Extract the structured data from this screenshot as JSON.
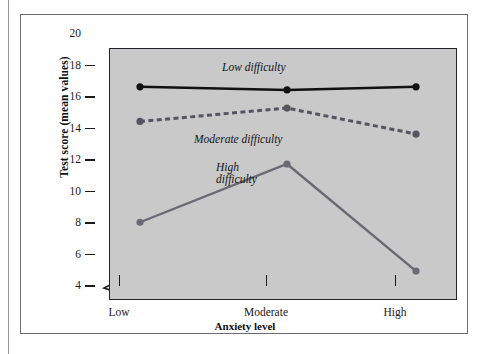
{
  "figure": {
    "background_color": "#ffffff",
    "frame_color": "#6b6b76",
    "plot_background_color": "#c9c9c9",
    "axis_color": "#1a1a1a"
  },
  "axes": {
    "y_title": "Test score (mean values)",
    "x_title": "Anxiety level",
    "y_ticks": [
      "20",
      "18",
      "16",
      "14",
      "12",
      "10",
      "8",
      "6",
      "4"
    ],
    "x_ticks": [
      "Low",
      "Moderate",
      "High"
    ],
    "axis_break_symbol": "axis-break"
  },
  "annotations": {
    "low": "Low difficulty",
    "moderate": "Moderate difficulty",
    "high": "High\ndifficulty"
  },
  "chart_data": {
    "type": "line",
    "title": "",
    "xlabel": "Anxiety level",
    "ylabel": "Test score (mean values)",
    "categories": [
      "Low",
      "Moderate",
      "High"
    ],
    "ylim": [
      4,
      20
    ],
    "yticks": [
      4,
      6,
      8,
      10,
      12,
      14,
      16,
      18,
      20
    ],
    "grid": false,
    "legend": "inline-annotations",
    "axis_break": true,
    "series": [
      {
        "name": "Low difficulty",
        "values": [
          17.6,
          17.4,
          17.6
        ],
        "color": "#111111",
        "style": "solid",
        "marker": "circle"
      },
      {
        "name": "Moderate difficulty",
        "values": [
          15.4,
          16.25,
          14.6
        ],
        "color": "#555560",
        "style": "dashed",
        "marker": "circle"
      },
      {
        "name": "High difficulty",
        "values": [
          9.0,
          12.7,
          5.9
        ],
        "color": "#6a6a74",
        "style": "solid",
        "marker": "circle"
      }
    ]
  }
}
